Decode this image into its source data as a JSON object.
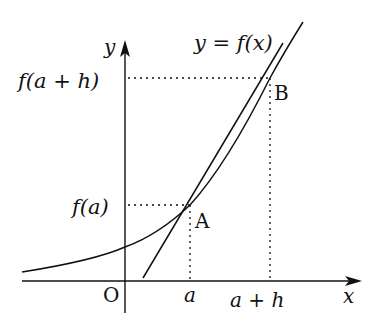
{
  "diagram": {
    "labels": {
      "curve": "y = f(x)",
      "y_axis": "y",
      "x_axis": "x",
      "origin": "O",
      "point_a": "A",
      "point_b": "B",
      "fa": "f(a)",
      "fah": "f(a + h)",
      "a": "a",
      "ah": "a + h"
    },
    "colors": {
      "stroke": "#111111",
      "background": "#ffffff"
    }
  }
}
